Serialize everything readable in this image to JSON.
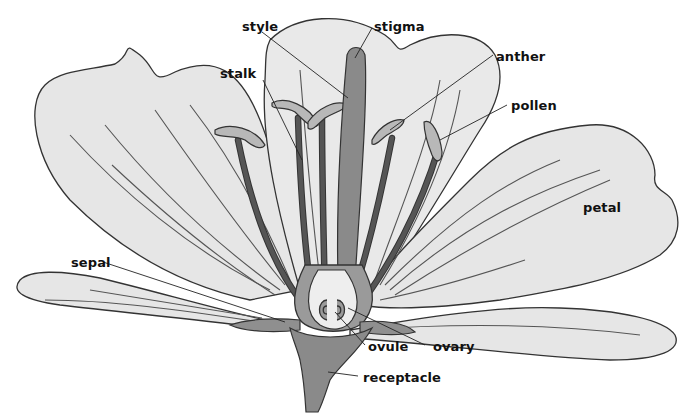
{
  "diagram": {
    "labels": {
      "style": "style",
      "stigma": "stigma",
      "stalk": "stalk",
      "anther": "anther",
      "pollen": "pollen",
      "petal": "petal",
      "sepal": "sepal",
      "ovule": "ovule",
      "ovary": "ovary",
      "receptacle": "receptacle"
    },
    "colors": {
      "petal_fill": "#e6e6e6",
      "outline": "#333333",
      "pistil_fill": "#8a8a8a",
      "background": "#ffffff"
    }
  }
}
